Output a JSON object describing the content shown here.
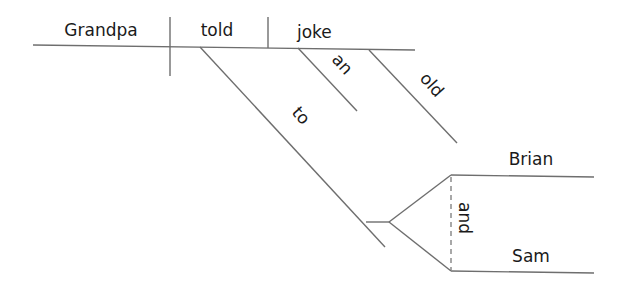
{
  "diagram": {
    "type": "sentence-diagram",
    "sentence": "Grandpa told an old joke to Brian and Sam",
    "words": {
      "subject": "Grandpa",
      "verb": "told",
      "object": "joke",
      "modifier_1": "an",
      "modifier_2": "old",
      "preposition": "to",
      "compound_object_1": "Brian",
      "conjunction": "and",
      "compound_object_2": "Sam"
    },
    "line_color": "#6e6e6e",
    "text_color": "#1a1a1a"
  }
}
